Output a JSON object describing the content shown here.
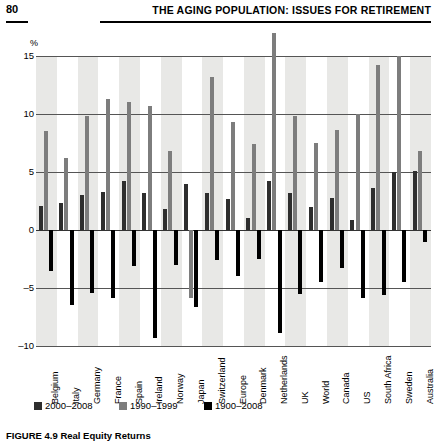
{
  "header": {
    "folio": "80",
    "running_head": "THE AGING POPULATION: ISSUES FOR RETIREMENT"
  },
  "caption": {
    "number": "FIGURE 4.9",
    "text": "Real Equity Returns"
  },
  "legend": {
    "items": [
      {
        "label": "2000–2008",
        "color": "#2e2e2e"
      },
      {
        "label": "1990–1999",
        "color": "#7d7d7d"
      },
      {
        "label": "1900–2008",
        "color": "#000000"
      }
    ]
  },
  "chart_data": {
    "type": "bar",
    "title": "",
    "subtitle": "",
    "xlabel": "",
    "ylabel": "%",
    "ylim": [
      -10,
      15
    ],
    "yticks": [
      15,
      10,
      5,
      0,
      -5,
      -10
    ],
    "ytick_labels": [
      "15",
      "10",
      "5",
      "0",
      "–5",
      "–10"
    ],
    "grid": true,
    "legend_position": "bottom-left",
    "categories": [
      "Belgium",
      "Italy",
      "Germany",
      "France",
      "Spain",
      "Ireland",
      "Norway",
      "Japan",
      "Switzerland",
      "Europe",
      "Denmark",
      "Netherlands",
      "UK",
      "World",
      "Canada",
      "US",
      "South Africa",
      "Sweden",
      "Australia"
    ],
    "series": [
      {
        "name": "2000–2008",
        "color": "#2e2e2e",
        "values": [
          2.1,
          2.3,
          3.0,
          3.3,
          4.2,
          3.2,
          1.8,
          4.0,
          3.2,
          2.7,
          1.0,
          4.2,
          3.2,
          2.0,
          2.8,
          0.9,
          3.6,
          5.0,
          5.1
        ]
      },
      {
        "name": "1990–1999",
        "color": "#7d7d7d",
        "values": [
          8.5,
          6.2,
          9.8,
          11.3,
          11.0,
          10.7,
          6.8,
          -5.9,
          13.2,
          9.3,
          7.4,
          17.0,
          9.8,
          7.5,
          8.6,
          10.0,
          14.2,
          15.0,
          6.8
        ]
      },
      {
        "name": "1900–2008",
        "color": "#000000",
        "values": [
          -3.5,
          -6.5,
          -5.4,
          -5.9,
          -3.1,
          -9.3,
          -3.0,
          -6.6,
          -2.6,
          -4.0,
          -2.5,
          -8.9,
          -5.5,
          -4.5,
          -3.3,
          -5.9,
          -5.6,
          -4.5,
          -1.0
        ]
      }
    ]
  }
}
